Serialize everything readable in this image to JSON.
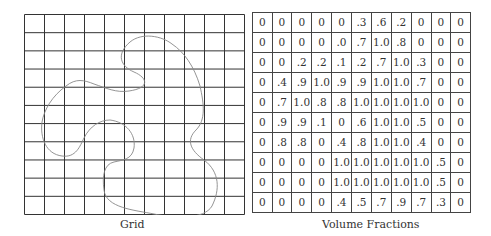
{
  "grid": {
    "caption": "Grid",
    "columns": 11,
    "rows": 11
  },
  "volume_fractions": {
    "caption": "Volume Fractions",
    "rows": [
      [
        "0",
        "0",
        "0",
        "0",
        "0",
        ".3",
        ".6",
        ".2",
        "0",
        "0",
        "0"
      ],
      [
        "0",
        "0",
        "0",
        "0",
        ".0",
        ".7",
        "1.0",
        ".8",
        "0",
        "0",
        "0"
      ],
      [
        "0",
        "0",
        ".2",
        ".2",
        ".1",
        ".2",
        ".7",
        "1.0",
        ".3",
        "0",
        "0"
      ],
      [
        "0",
        ".4",
        ".9",
        "1.0",
        ".9",
        ".9",
        "1.0",
        "1.0",
        ".7",
        "0",
        "0"
      ],
      [
        "0",
        ".7",
        "1.0",
        ".8",
        ".8",
        "1.0",
        "1.0",
        "1.0",
        "1.0",
        "0",
        "0"
      ],
      [
        "0",
        ".9",
        ".9",
        ".1",
        "0",
        ".6",
        "1.0",
        "1.0",
        ".5",
        "0",
        "0"
      ],
      [
        "0",
        ".8",
        ".8",
        "0",
        ".4",
        ".8",
        "1.0",
        "1.0",
        ".4",
        "0",
        "0"
      ],
      [
        "0",
        "0",
        "0",
        "0",
        "1.0",
        "1.0",
        "1.0",
        "1.0",
        "1.0",
        ".5",
        "0"
      ],
      [
        "0",
        "0",
        "0",
        "0",
        "1.0",
        "1.0",
        "1.0",
        "1.0",
        "1.0",
        ".5",
        "0"
      ],
      [
        "0",
        "0",
        "0",
        "0",
        ".4",
        ".5",
        ".7",
        ".9",
        ".7",
        ".3",
        "0"
      ]
    ]
  }
}
